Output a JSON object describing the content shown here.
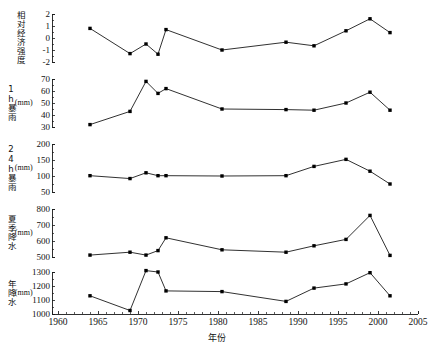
{
  "figure": {
    "width": 433,
    "height": 350,
    "background": "#ffffff",
    "line_color": "#1a1a1a",
    "marker_color": "#000000",
    "axis_color": "#1a1a1a"
  },
  "xaxis": {
    "title": "年份",
    "min": 1960,
    "max": 2005,
    "ticks": [
      1960,
      1965,
      1970,
      1975,
      1980,
      1985,
      1990,
      1995,
      2000,
      2005
    ],
    "tick_labels": [
      "1960",
      "1965",
      "1970",
      "1975",
      "1980",
      "1985",
      "1990",
      "1995",
      "2000",
      "2005"
    ],
    "minor_tick_step": 1
  },
  "chart_data": {
    "type": "line",
    "title": "",
    "xlabel": "年份",
    "ylabel": "",
    "grid": false,
    "legend": "none",
    "shared_x": true,
    "x": [
      1964,
      1969,
      1971,
      1972.5,
      1973.5,
      1980.5,
      1988.5,
      1992,
      1996,
      1999,
      2001.5
    ],
    "xlim": [
      1960,
      2005
    ],
    "panels": [
      {
        "name": "relative-intensity",
        "ylabel_main": "相对经济强度",
        "ylabel_unit": "",
        "ylim": [
          -2,
          2
        ],
        "yticks": [
          -2,
          -1,
          0,
          1,
          2
        ],
        "ytick_labels": [
          "-2",
          "-1",
          "0",
          "1",
          "2"
        ],
        "values": [
          0.8,
          -1.3,
          -0.5,
          -1.35,
          0.7,
          -1.0,
          -0.35,
          -0.65,
          0.6,
          1.6,
          0.45
        ]
      },
      {
        "name": "1h-rainstorm",
        "ylabel_main": "1h暴雨",
        "ylabel_unit": "(mm)",
        "ylim": [
          30,
          70
        ],
        "yticks": [
          30,
          40,
          50,
          60,
          70
        ],
        "ytick_labels": [
          "30",
          "40",
          "50",
          "60",
          "70"
        ],
        "values": [
          32,
          43,
          68,
          58,
          62,
          45,
          44.5,
          44,
          50,
          59,
          44
        ]
      },
      {
        "name": "24h-rainstorm",
        "ylabel_main": "24h暴雨",
        "ylabel_unit": "(mm)",
        "ylim": [
          50,
          200
        ],
        "yticks": [
          50,
          100,
          150,
          200
        ],
        "ytick_labels": [
          "50",
          "100",
          "150",
          "200"
        ],
        "values": [
          101,
          92,
          110,
          101,
          101,
          100,
          101,
          130,
          152,
          115,
          75
        ]
      },
      {
        "name": "summer-precipitation",
        "ylabel_main": "夏季降水",
        "ylabel_unit": "(mm)",
        "ylim": [
          500,
          800
        ],
        "yticks": [
          500,
          600,
          700,
          800
        ],
        "ytick_labels": [
          "500",
          "600",
          "700",
          "800"
        ],
        "values": [
          512,
          530,
          512,
          540,
          620,
          545,
          530,
          570,
          610,
          760,
          510
        ]
      },
      {
        "name": "annual-precipitation",
        "ylabel_main": "年降水",
        "ylabel_unit": "(mm)",
        "ylim": [
          1000,
          1300
        ],
        "yticks": [
          1000,
          1100,
          1200,
          1300
        ],
        "ytick_labels": [
          "1000",
          "1100",
          "1200",
          "1300"
        ],
        "values": [
          1130,
          1025,
          1310,
          1300,
          1165,
          1160,
          1090,
          1185,
          1215,
          1295,
          1130
        ]
      }
    ]
  }
}
